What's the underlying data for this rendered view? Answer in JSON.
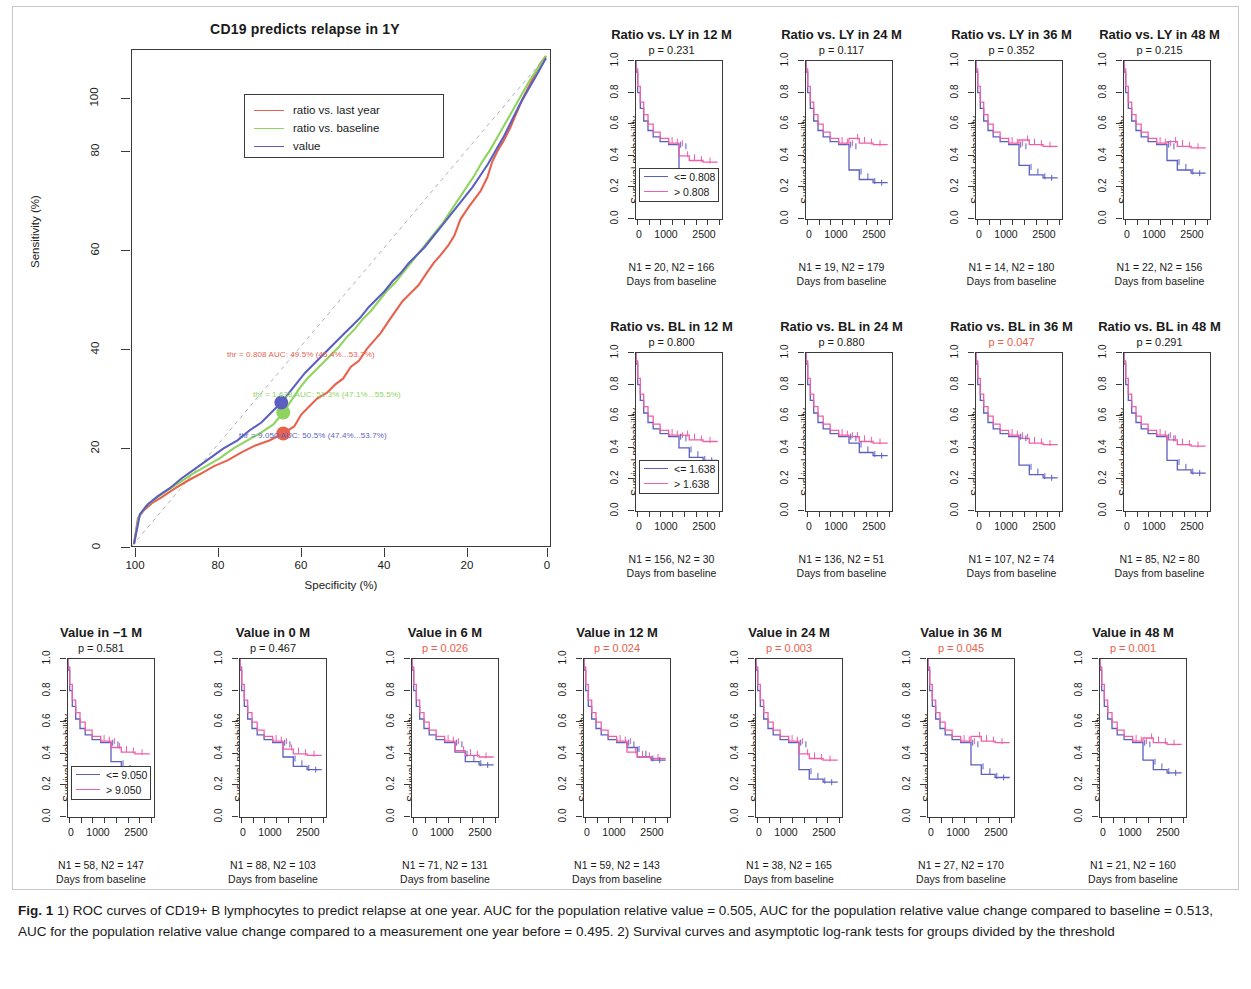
{
  "figure": {
    "caption_label": "Fig. 1",
    "caption_text": " 1) ROC curves of CD19+ B lymphocytes to predict relapse at one year. AUC for the population relative value = 0.505, AUC for the population relative value change compared to baseline = 0.513, AUC for the population relative value change compared to a measurement one year before = 0.495. 2) Survival curves and asymptotic log-rank tests for groups divided by the threshold"
  },
  "colors": {
    "red": "#e8614d",
    "green": "#8ed45e",
    "blue": "#5b5fc0",
    "pink": "#ef5fa8",
    "axis": "#3a3a3a"
  },
  "chart_data": [
    {
      "type": "line",
      "id": "roc",
      "title": "CD19 predicts relapse in 1Y",
      "xlabel": "Specificity (%)",
      "ylabel": "Sensitivity (%)",
      "xticks": [
        "100",
        "80",
        "60",
        "40",
        "20",
        "0"
      ],
      "yticks": [
        "0",
        "20",
        "40",
        "60",
        "80",
        "100"
      ],
      "xlim": [
        100,
        0
      ],
      "ylim": [
        0,
        100
      ],
      "grid": false,
      "legend_position": "top-left",
      "legend": [
        {
          "label": "ratio vs. last year",
          "color": "#e8614d"
        },
        {
          "label": "ratio vs. baseline",
          "color": "#8ed45e"
        },
        {
          "label": "value",
          "color": "#5b5fc0"
        }
      ],
      "annotations": [
        {
          "text": "thr = 0.808    AUC: 49.5% (45.4%...53.7%)",
          "color": "#e8614d",
          "thr": 0.808,
          "auc": 49.5,
          "ci": [
            45.4,
            53.7
          ]
        },
        {
          "text": "thr = 1.638    AUC: 51.3% (47.1%...55.5%)",
          "color": "#8ed45e",
          "thr": 1.638,
          "auc": 51.3,
          "ci": [
            47.1,
            55.5
          ]
        },
        {
          "text": "thr = 9.050    AUC: 50.5% (47.4%...53.7%)",
          "color": "#5b5fc0",
          "thr": 9.05,
          "auc": 50.5,
          "ci": [
            47.4,
            53.7
          ]
        }
      ]
    },
    {
      "type": "line",
      "id": "km-grid",
      "subtype": "kaplan-meier",
      "ylabel": "Survival probability",
      "xlabel": "Days from baseline",
      "yticks": [
        "0.0",
        "0.2",
        "0.4",
        "0.6",
        "0.8",
        "1.0"
      ],
      "xticks": [
        "0",
        "1000",
        "2500"
      ],
      "ylim": [
        0,
        1
      ],
      "xlim": [
        0,
        3000
      ],
      "panels": [
        {
          "title": "Ratio vs. LY in 12 M",
          "p": "p = 0.231",
          "significant": false,
          "low": "<= 0.808",
          "high": "> 0.808",
          "n": "N1 = 20, N2 = 166",
          "n1": 20,
          "n2": 166,
          "show_legend": true
        },
        {
          "title": "Ratio vs. LY in 24 M",
          "p": "p = 0.117",
          "significant": false,
          "low": "<= 0.808",
          "high": "> 0.808",
          "n": "N1 = 19, N2 = 179",
          "n1": 19,
          "n2": 179,
          "show_legend": false
        },
        {
          "title": "Ratio vs. LY in 36 M",
          "p": "p = 0.352",
          "significant": false,
          "low": "<= 0.808",
          "high": "> 0.808",
          "n": "N1 = 14, N2 = 180",
          "n1": 14,
          "n2": 180,
          "show_legend": false
        },
        {
          "title": "Ratio vs. LY in 48 M",
          "p": "p = 0.215",
          "significant": false,
          "low": "<= 0.808",
          "high": "> 0.808",
          "n": "N1 = 22, N2 = 156",
          "n1": 22,
          "n2": 156,
          "show_legend": false
        },
        {
          "title": "Ratio vs. BL in 12 M",
          "p": "p = 0.800",
          "significant": false,
          "low": "<= 1.638",
          "high": "> 1.638",
          "n": "N1 = 156, N2 = 30",
          "n1": 156,
          "n2": 30,
          "show_legend": true
        },
        {
          "title": "Ratio vs. BL in 24 M",
          "p": "p = 0.880",
          "significant": false,
          "low": "<= 1.638",
          "high": "> 1.638",
          "n": "N1 = 136, N2 = 51",
          "n1": 136,
          "n2": 51,
          "show_legend": false
        },
        {
          "title": "Ratio vs. BL in 36 M",
          "p": "p = 0.047",
          "significant": true,
          "low": "<= 1.638",
          "high": "> 1.638",
          "n": "N1 = 107, N2 = 74",
          "n1": 107,
          "n2": 74,
          "show_legend": false
        },
        {
          "title": "Ratio vs. BL in 48 M",
          "p": "p = 0.291",
          "significant": false,
          "low": "<= 1.638",
          "high": "> 1.638",
          "n": "N1 = 85, N2 = 80",
          "n1": 85,
          "n2": 80,
          "show_legend": false
        },
        {
          "title": "Value in −1 M",
          "p": "p = 0.581",
          "significant": false,
          "low": "<= 9.050",
          "high": "> 9.050",
          "n": "N1 = 58, N2 = 147",
          "n1": 58,
          "n2": 147,
          "show_legend": true
        },
        {
          "title": "Value in 0 M",
          "p": "p = 0.467",
          "significant": false,
          "low": "<= 9.050",
          "high": "> 9.050",
          "n": "N1 = 88, N2 = 103",
          "n1": 88,
          "n2": 103,
          "show_legend": false
        },
        {
          "title": "Value in 6 M",
          "p": "p = 0.026",
          "significant": true,
          "low": "<= 9.050",
          "high": "> 9.050",
          "n": "N1 = 71, N2 = 131",
          "n1": 71,
          "n2": 131,
          "show_legend": false
        },
        {
          "title": "Value in 12 M",
          "p": "p = 0.024",
          "significant": true,
          "low": "<= 9.050",
          "high": "> 9.050",
          "n": "N1 = 59, N2 = 143",
          "n1": 59,
          "n2": 143,
          "show_legend": false
        },
        {
          "title": "Value in 24 M",
          "p": "p = 0.003",
          "significant": true,
          "low": "<= 9.050",
          "high": "> 9.050",
          "n": "N1 = 38, N2 = 165",
          "n1": 38,
          "n2": 165,
          "show_legend": false
        },
        {
          "title": "Value in 36 M",
          "p": "p = 0.045",
          "significant": true,
          "low": "<= 9.050",
          "high": "> 9.050",
          "n": "N1 = 27, N2 = 170",
          "n1": 27,
          "n2": 170,
          "show_legend": false
        },
        {
          "title": "Value in 48 M",
          "p": "p = 0.001",
          "significant": true,
          "low": "<= 9.050",
          "high": "> 9.050",
          "n": "N1 = 21, N2 = 160",
          "n1": 21,
          "n2": 160,
          "show_legend": false
        }
      ]
    }
  ]
}
